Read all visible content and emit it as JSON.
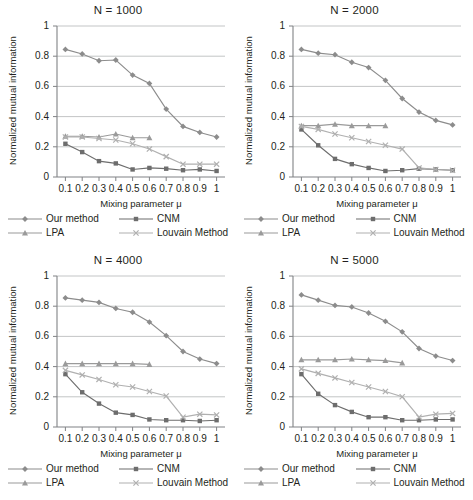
{
  "figure": {
    "shared_xlabel": "Mixing parameter μ",
    "shared_ylabel": "Normalized mutual information",
    "ylim": [
      0,
      1
    ],
    "yticks": [
      "0",
      "0.2",
      "0.4",
      "0.6",
      "0.8",
      "1"
    ],
    "ytick_values": [
      0,
      0.2,
      0.4,
      0.6,
      0.8,
      1
    ],
    "xticks": [
      "0.1",
      "0.2",
      "0.3",
      "0.4",
      "0.5",
      "0.6",
      "0.7",
      "0.8",
      "0.9",
      "1"
    ],
    "xtick_values": [
      0.1,
      0.2,
      0.3,
      0.4,
      0.5,
      0.6,
      0.7,
      0.8,
      0.9,
      1.0
    ],
    "grid": "horizontal",
    "legend_position": "below-axes",
    "legend": [
      {
        "label": "Our method",
        "marker": "diamond",
        "color": "#8c8c8c"
      },
      {
        "label": "CNM",
        "marker": "square",
        "color": "#6d6d6d"
      },
      {
        "label": "LPA",
        "marker": "triangle",
        "color": "#9a9a9a"
      },
      {
        "label": "Louvain Method",
        "marker": "cross",
        "color": "#b0b0b0"
      }
    ]
  },
  "chart_data": [
    {
      "type": "line",
      "title": "N = 1000",
      "xlabel": "Mixing parameter μ",
      "ylabel": "Normalized mutual information",
      "x": [
        0.1,
        0.2,
        0.3,
        0.4,
        0.5,
        0.6,
        0.7,
        0.8,
        0.9,
        1.0
      ],
      "ylim": [
        0,
        1
      ],
      "xlim": [
        0.05,
        1.05
      ],
      "series": [
        {
          "name": "Our method",
          "marker": "diamond",
          "color": "#8c8c8c",
          "values": [
            0.845,
            0.815,
            0.77,
            0.775,
            0.675,
            0.62,
            0.45,
            0.335,
            0.295,
            0.265
          ]
        },
        {
          "name": "CNM",
          "marker": "square",
          "color": "#6d6d6d",
          "values": [
            0.22,
            0.165,
            0.105,
            0.09,
            0.05,
            0.06,
            0.055,
            0.045,
            0.05,
            0.04
          ]
        },
        {
          "name": "LPA",
          "marker": "triangle",
          "color": "#9a9a9a",
          "values": [
            0.27,
            0.27,
            0.265,
            0.285,
            0.26,
            0.26,
            null,
            null,
            null,
            null
          ]
        },
        {
          "name": "Louvain Method",
          "marker": "cross",
          "color": "#b0b0b0",
          "values": [
            0.265,
            0.265,
            0.255,
            0.245,
            0.22,
            0.185,
            0.135,
            0.085,
            0.085,
            0.085
          ]
        }
      ]
    },
    {
      "type": "line",
      "title": "N = 2000",
      "xlabel": "Mixing parameter μ",
      "ylabel": "Normalized mutual information",
      "x": [
        0.1,
        0.2,
        0.3,
        0.4,
        0.5,
        0.6,
        0.7,
        0.8,
        0.9,
        1.0
      ],
      "ylim": [
        0,
        1
      ],
      "xlim": [
        0.05,
        1.05
      ],
      "series": [
        {
          "name": "Our method",
          "marker": "diamond",
          "color": "#8c8c8c",
          "values": [
            0.845,
            0.82,
            0.81,
            0.76,
            0.725,
            0.64,
            0.52,
            0.43,
            0.375,
            0.345
          ]
        },
        {
          "name": "CNM",
          "marker": "square",
          "color": "#6d6d6d",
          "values": [
            0.315,
            0.21,
            0.12,
            0.085,
            0.06,
            0.04,
            0.045,
            0.055,
            0.05,
            0.045
          ]
        },
        {
          "name": "LPA",
          "marker": "triangle",
          "color": "#9a9a9a",
          "values": [
            0.34,
            0.34,
            0.35,
            0.34,
            0.34,
            0.34,
            null,
            null,
            null,
            null
          ]
        },
        {
          "name": "Louvain Method",
          "marker": "cross",
          "color": "#b0b0b0",
          "values": [
            0.335,
            0.315,
            0.285,
            0.26,
            0.235,
            0.21,
            0.185,
            0.06,
            0.05,
            0.045
          ]
        }
      ]
    },
    {
      "type": "line",
      "title": "N = 4000",
      "xlabel": "Mixing parameter μ",
      "ylabel": "Normalized mutual information",
      "x": [
        0.1,
        0.2,
        0.3,
        0.4,
        0.5,
        0.6,
        0.7,
        0.8,
        0.9,
        1.0
      ],
      "ylim": [
        0,
        1
      ],
      "xlim": [
        0.05,
        1.05
      ],
      "series": [
        {
          "name": "Our method",
          "marker": "diamond",
          "color": "#8c8c8c",
          "values": [
            0.855,
            0.84,
            0.825,
            0.785,
            0.76,
            0.695,
            0.605,
            0.5,
            0.45,
            0.42
          ]
        },
        {
          "name": "CNM",
          "marker": "square",
          "color": "#6d6d6d",
          "values": [
            0.35,
            0.23,
            0.155,
            0.095,
            0.08,
            0.05,
            0.045,
            0.045,
            0.04,
            0.045
          ]
        },
        {
          "name": "LPA",
          "marker": "triangle",
          "color": "#9a9a9a",
          "values": [
            0.42,
            0.42,
            0.42,
            0.42,
            0.42,
            0.415,
            null,
            null,
            null,
            null
          ]
        },
        {
          "name": "Louvain Method",
          "marker": "cross",
          "color": "#b0b0b0",
          "values": [
            0.375,
            0.345,
            0.315,
            0.28,
            0.265,
            0.235,
            0.205,
            0.065,
            0.085,
            0.08
          ]
        }
      ]
    },
    {
      "type": "line",
      "title": "N = 5000",
      "xlabel": "Mixing parameter μ",
      "ylabel": "Normalized mutual information",
      "x": [
        0.1,
        0.2,
        0.3,
        0.4,
        0.5,
        0.6,
        0.7,
        0.8,
        0.9,
        1.0
      ],
      "ylim": [
        0,
        1
      ],
      "xlim": [
        0.05,
        1.05
      ],
      "series": [
        {
          "name": "Our method",
          "marker": "diamond",
          "color": "#8c8c8c",
          "values": [
            0.875,
            0.84,
            0.805,
            0.795,
            0.755,
            0.7,
            0.63,
            0.52,
            0.47,
            0.44
          ]
        },
        {
          "name": "CNM",
          "marker": "square",
          "color": "#6d6d6d",
          "values": [
            0.35,
            0.22,
            0.145,
            0.1,
            0.065,
            0.065,
            0.045,
            0.045,
            0.05,
            0.05
          ]
        },
        {
          "name": "LPA",
          "marker": "triangle",
          "color": "#9a9a9a",
          "values": [
            0.445,
            0.445,
            0.445,
            0.45,
            0.445,
            0.44,
            0.425,
            null,
            null,
            null
          ]
        },
        {
          "name": "Louvain Method",
          "marker": "cross",
          "color": "#b0b0b0",
          "values": [
            0.385,
            0.355,
            0.325,
            0.295,
            0.265,
            0.235,
            0.2,
            0.065,
            0.085,
            0.09
          ]
        }
      ]
    }
  ]
}
